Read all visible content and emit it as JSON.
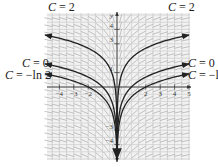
{
  "chart_data": {
    "type": "line",
    "title": "",
    "xlabel": "x",
    "ylabel": "y",
    "xlim": [
      -5,
      5
    ],
    "ylim": [
      -5,
      5
    ],
    "x_ticks": [
      -4,
      -3,
      -2,
      2,
      3,
      4,
      5
    ],
    "y_ticks": [
      4,
      3,
      1,
      -3,
      -4
    ],
    "grid": true,
    "slope_field": true,
    "series": [
      {
        "name": "C = 2",
        "C": 2,
        "function": "ln|x| + 2",
        "label_left": "C = 2",
        "label_right": "C = 2"
      },
      {
        "name": "C = 0",
        "C": 0,
        "function": "ln|x|",
        "label_left": "C = 0",
        "label_right": "C = 0"
      },
      {
        "name": "C = −ln 2",
        "C": -0.6931,
        "function": "ln|x| − ln 2",
        "label_left": "C = −ln 2",
        "label_right": "C = −ln"
      }
    ]
  },
  "labels": {
    "top_left": {
      "c": "C",
      "rest": " = 2"
    },
    "top_right": {
      "c": "C",
      "rest": " = 2"
    },
    "mid_left_1": {
      "c": "C",
      "rest": " = 0"
    },
    "mid_left_2": {
      "c": "C",
      "rest": " = −ln 2"
    },
    "mid_right_1": {
      "c": "C",
      "rest": " = 0"
    },
    "mid_right_2": {
      "c": "C",
      "rest": " = −ln"
    }
  },
  "axes": {
    "x_tick_labels": [
      "−4",
      "−3",
      "−2",
      "2",
      "3",
      "4",
      "5"
    ],
    "y_tick_labels": [
      "4",
      "3",
      "1",
      "−3",
      "−4"
    ],
    "y_axis_label": "y"
  },
  "colors": {
    "curve": "#222222",
    "grid": "#bdbdbd",
    "field": "#9a9a9a",
    "axis": "#333333"
  }
}
